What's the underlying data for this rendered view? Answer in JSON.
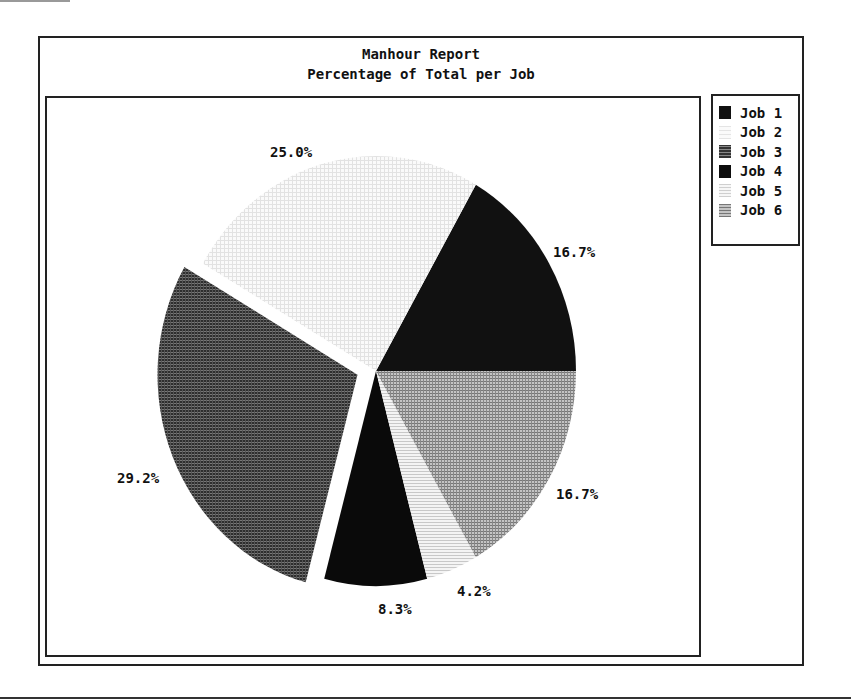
{
  "chart_data": {
    "type": "pie",
    "title": "Manhour Report",
    "subtitle": "Percentage of Total per Job",
    "categories": [
      "Job 1",
      "Job 2",
      "Job 3",
      "Job 4",
      "Job 5",
      "Job 6"
    ],
    "values": [
      16.7,
      25.0,
      29.2,
      8.3,
      4.2,
      16.7
    ],
    "labels": [
      "16.7%",
      "25.0%",
      "29.2%",
      "8.3%",
      "4.2%",
      "16.7%"
    ],
    "exploded": [
      "Job 3"
    ],
    "fills": [
      "#111111",
      "#f1f1f1",
      "#4a4a4a",
      "#0d0d0d",
      "#dedede",
      "#9a9a9a"
    ],
    "legend_position": "right",
    "start_angle_deg": 0,
    "direction": "counterclockwise"
  },
  "legend": {
    "items": [
      {
        "label": "Job 1"
      },
      {
        "label": "Job 2"
      },
      {
        "label": "Job 3"
      },
      {
        "label": "Job 4"
      },
      {
        "label": "Job 5"
      },
      {
        "label": "Job 6"
      }
    ]
  }
}
